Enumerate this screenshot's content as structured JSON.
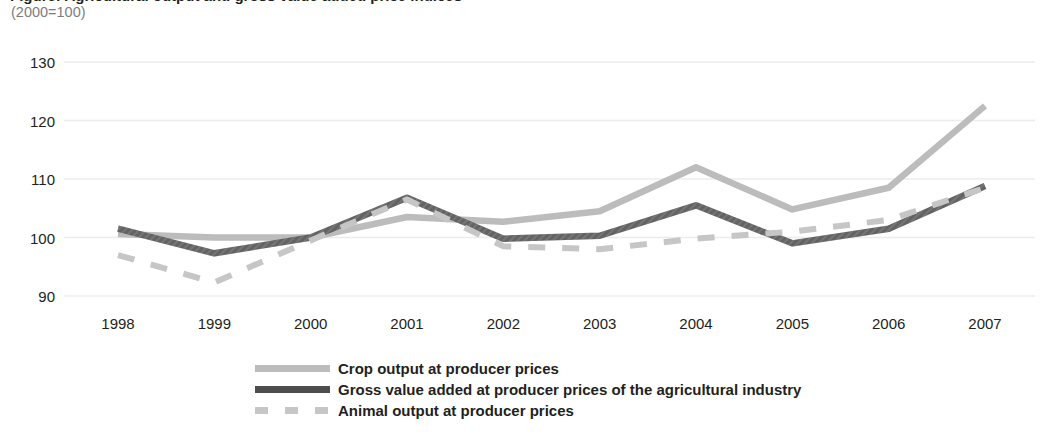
{
  "header": {
    "title": "Figure: Agricultural output and gross value added price indices",
    "subtitle": "(2000=100)"
  },
  "colors": {
    "crop_line": "#bcbcbc",
    "gva_line": "#4d4d4d",
    "animal_line": "#c6c6c6",
    "gridline": "#ececec",
    "text": "#231f20",
    "subtitle_text": "#7d7d7d"
  },
  "chart_data": {
    "type": "line",
    "title": "Figure: Agricultural output and gross value added price indices",
    "subtitle": "(2000=100)",
    "xlabel": "",
    "ylabel": "",
    "categories": [
      "1998",
      "1999",
      "2000",
      "2001",
      "2002",
      "2003",
      "2004",
      "2005",
      "2006",
      "2007"
    ],
    "x": [
      1998,
      1999,
      2000,
      2001,
      2002,
      2003,
      2004,
      2005,
      2006,
      2007
    ],
    "ylim": [
      90,
      130
    ],
    "yticks": [
      90,
      100,
      110,
      120,
      130
    ],
    "grid": true,
    "legend_position": "bottom",
    "series": [
      {
        "name": "Crop output at producer prices",
        "style": "solid",
        "color": "#bcbcbc",
        "values": [
          100.6,
          100.0,
          100.0,
          103.5,
          102.7,
          104.5,
          112.0,
          104.8,
          108.5,
          122.5
        ]
      },
      {
        "name": "Gross value added at producer prices of the agricultural industry",
        "style": "solid-hatched",
        "color": "#4d4d4d",
        "values": [
          101.5,
          97.3,
          100.0,
          106.8,
          99.8,
          100.3,
          105.5,
          99.0,
          101.5,
          108.8
        ]
      },
      {
        "name": "Animal output at producer prices",
        "style": "dashed",
        "color": "#c6c6c6",
        "values": [
          97.0,
          92.3,
          99.5,
          106.5,
          98.5,
          98.0,
          99.8,
          101.0,
          103.0,
          108.5
        ]
      }
    ]
  },
  "legend": {
    "items": [
      {
        "label": "Crop output at producer prices",
        "swatch": "solid-light-line-icon"
      },
      {
        "label": "Gross value added at producer prices of the agricultural industry",
        "swatch": "hatched-dark-line-icon"
      },
      {
        "label": "Animal output at producer prices",
        "swatch": "dashed-light-line-icon"
      }
    ]
  }
}
